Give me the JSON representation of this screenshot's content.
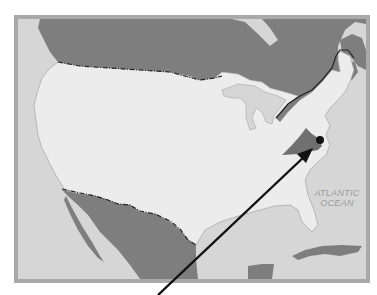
{
  "map": {
    "region": "United States",
    "highlighted_state": "Virginia",
    "marker": "location dot",
    "colors": {
      "ocean": "#d6d6d6",
      "frame": "#a9a9a9",
      "usa": "#ececec",
      "foreign_land": "#7e7e7e",
      "highlight": "#707070",
      "marker": "#111111",
      "border_line": "#222222"
    },
    "labels": {
      "ocean_line1": "ATLANTIC",
      "ocean_line2": "OCEAN"
    },
    "arrow": {
      "from": [
        158,
        295
      ],
      "to": [
        312,
        148
      ]
    }
  }
}
